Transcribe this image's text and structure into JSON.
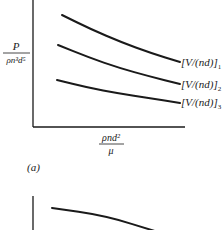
{
  "chart_data": [
    {
      "type": "line",
      "panel_label": "(a)",
      "ylabel": {
        "numerator": "P",
        "denominator": "ρn³d⁵"
      },
      "xlabel": {
        "numerator": "ρnd²",
        "denominator": "μ"
      },
      "grid": false,
      "series": [
        {
          "name": "[V/(nd)]₁",
          "label_text": "[V/(nd)]",
          "subscript": "1",
          "x": [
            0.0,
            0.25,
            0.5,
            0.75,
            1.0
          ],
          "y": [
            1.0,
            0.84,
            0.7,
            0.58,
            0.48
          ]
        },
        {
          "name": "[V/(nd)]₂",
          "label_text": "[V/(nd)]",
          "subscript": "2",
          "x": [
            0.0,
            0.25,
            0.5,
            0.75,
            1.0
          ],
          "y": [
            0.77,
            0.64,
            0.53,
            0.44,
            0.36
          ]
        },
        {
          "name": "[V/(nd)]₃",
          "label_text": "[V/(nd)]",
          "subscript": "3",
          "x": [
            0.0,
            0.25,
            0.5,
            0.75,
            1.0
          ],
          "y": [
            0.5,
            0.42,
            0.36,
            0.31,
            0.26
          ]
        }
      ],
      "xlim": [
        0,
        1.1
      ],
      "ylim": [
        0,
        1.15
      ]
    },
    {
      "type": "line",
      "panel_label": "",
      "partial": true,
      "series": [
        {
          "name": "curve",
          "x": [
            0.0,
            0.4,
            0.8
          ],
          "y": [
            1.0,
            0.92,
            0.75
          ]
        }
      ]
    }
  ]
}
